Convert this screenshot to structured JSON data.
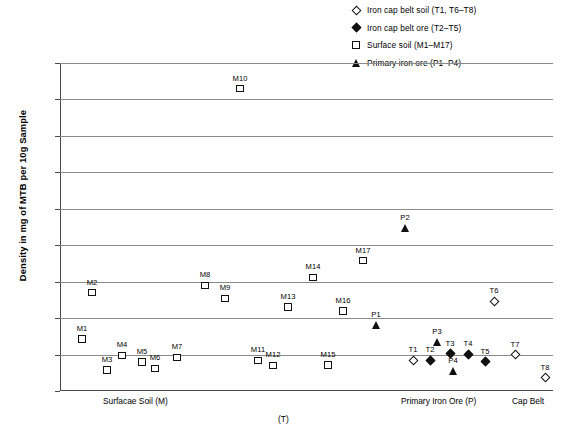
{
  "chart_data": {
    "type": "scatter",
    "title": "",
    "xlabel": "(T)",
    "ylabel": "Density in mg of MTB per 10g Sample",
    "ylim": [
      0,
      4500
    ],
    "ytick_labels": [
      "0",
      "500",
      "1,000",
      "1,500",
      "2,000",
      "2,500",
      "3,000",
      "3,500",
      "4,000",
      "4,500"
    ],
    "ytick_values": [
      0,
      500,
      1000,
      1500,
      2000,
      2500,
      3000,
      3500,
      4000,
      4500
    ],
    "grid": true,
    "legend_position": "top-right",
    "x_category_labels": [
      "Surfacae Soil (M)",
      "Primary Iron Ore (P)",
      "Cap Belt"
    ],
    "series": [
      {
        "name": "Iron cap belt soil (T1, T6–T8)",
        "marker": "diamond-open",
        "points": [
          {
            "label": "T1",
            "x": 353,
            "y": 420
          },
          {
            "label": "T6",
            "x": 434,
            "y": 1230
          },
          {
            "label": "T7",
            "x": 455,
            "y": 500
          },
          {
            "label": "T8",
            "x": 485,
            "y": 180
          }
        ]
      },
      {
        "name": "Iron cap belt ore (T2–T5)",
        "marker": "diamond-filled",
        "points": [
          {
            "label": "T2",
            "x": 370,
            "y": 420
          },
          {
            "label": "T3",
            "x": 390,
            "y": 510
          },
          {
            "label": "T4",
            "x": 408,
            "y": 505
          },
          {
            "label": "T5",
            "x": 425,
            "y": 400
          }
        ]
      },
      {
        "name": "Surface soil (M1–M17)",
        "marker": "square-open",
        "points": [
          {
            "label": "M1",
            "x": 22,
            "y": 715
          },
          {
            "label": "M2",
            "x": 32,
            "y": 1350
          },
          {
            "label": "M3",
            "x": 47,
            "y": 290
          },
          {
            "label": "M4",
            "x": 62,
            "y": 490
          },
          {
            "label": "M5",
            "x": 82,
            "y": 400
          },
          {
            "label": "M6",
            "x": 95,
            "y": 310
          },
          {
            "label": "M7",
            "x": 117,
            "y": 460
          },
          {
            "label": "M8",
            "x": 145,
            "y": 1450
          },
          {
            "label": "M9",
            "x": 165,
            "y": 1270
          },
          {
            "label": "M10",
            "x": 180,
            "y": 4150
          },
          {
            "label": "M11",
            "x": 198,
            "y": 420
          },
          {
            "label": "M12",
            "x": 213,
            "y": 350
          },
          {
            "label": "M13",
            "x": 228,
            "y": 1150
          },
          {
            "label": "M14",
            "x": 253,
            "y": 1560
          },
          {
            "label": "M15",
            "x": 268,
            "y": 360
          },
          {
            "label": "M16",
            "x": 283,
            "y": 1100
          },
          {
            "label": "M17",
            "x": 303,
            "y": 1790
          }
        ]
      },
      {
        "name": "Primary iron ore (P1–P4)",
        "marker": "triangle-filled",
        "points": [
          {
            "label": "P1",
            "x": 316,
            "y": 900
          },
          {
            "label": "P2",
            "x": 345,
            "y": 2230
          },
          {
            "label": "P3",
            "x": 377,
            "y": 670
          },
          {
            "label": "P4",
            "x": 393,
            "y": 280
          }
        ]
      }
    ]
  },
  "legend": {
    "items": [
      {
        "label": "Iron cap belt soil (T1, T6–T8)",
        "marker": "diamond-open"
      },
      {
        "label": "Iron cap belt ore (T2–T5)",
        "marker": "diamond-filled"
      },
      {
        "label": "Surface soil (M1–M17)",
        "marker": "square-open"
      },
      {
        "label": "Primary iron ore (P1–P4)",
        "marker": "triangle-filled"
      }
    ]
  },
  "axes": {
    "y_title": "Density in mg of MTB per 10g Sample",
    "x_sub_label": "(T)",
    "x_categories": [
      {
        "label": "Surfacae Soil (M)",
        "x": 43
      },
      {
        "label": "Primary Iron Ore (P)",
        "x": 341
      },
      {
        "label": "Cap Belt",
        "x": 452
      }
    ]
  }
}
